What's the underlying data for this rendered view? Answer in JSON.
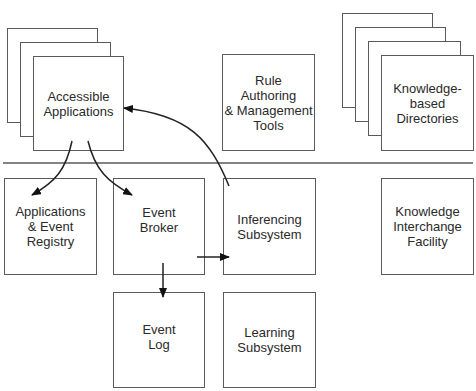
{
  "diagram": {
    "top_row": {
      "accessible_applications": {
        "label": "Accessible\nApplications",
        "stacked_copies": 3
      },
      "rule_authoring": {
        "label": "Rule\nAuthoring\n& Management\nTools"
      },
      "knowledge_directories": {
        "label": "Knowledge-\nbased\nDirectories",
        "stacked_copies": 4
      }
    },
    "bottom_rows": {
      "apps_event_registry": {
        "label": "Applications\n& Event\nRegistry"
      },
      "event_broker": {
        "label": "Event\nBroker"
      },
      "inferencing_subsystem": {
        "label": "Inferencing\nSubsystem"
      },
      "knowledge_interchange": {
        "label": "Knowledge\nInterchange\nFacility"
      },
      "event_log": {
        "label": "Event\nLog"
      },
      "learning_subsystem": {
        "label": "Learning\nSubsystem"
      }
    },
    "arrows": [
      {
        "from": "Accessible Applications",
        "to": "Applications & Event Registry"
      },
      {
        "from": "Accessible Applications",
        "to": "Event Broker"
      },
      {
        "from": "Inferencing Subsystem",
        "to": "Accessible Applications"
      },
      {
        "from": "Event Broker",
        "to": "Inferencing Subsystem"
      },
      {
        "from": "Event Broker",
        "to": "Event Log"
      }
    ],
    "colors": {
      "line": "#5a5a5a",
      "arrow": "#111111",
      "text": "#2a2a2a"
    }
  }
}
